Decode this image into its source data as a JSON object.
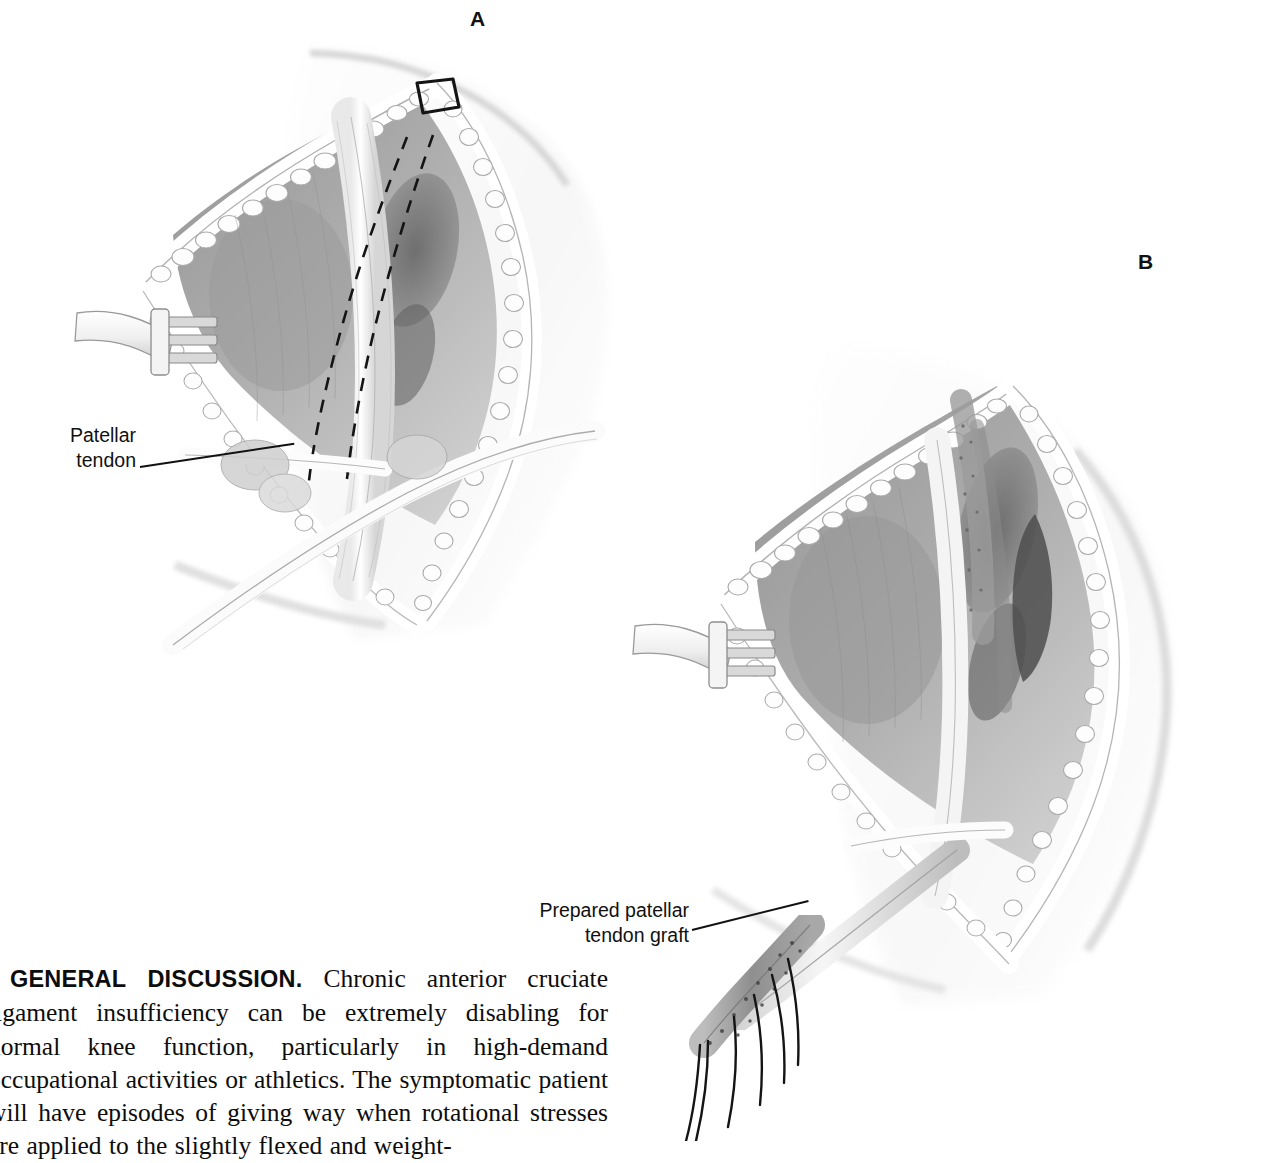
{
  "page": {
    "background_color": "#ffffff",
    "ink_color": "#111111",
    "width": 1264,
    "height": 1141
  },
  "panels": [
    {
      "letter": "A",
      "name": "panel-a",
      "description": "Open knee exposure with rake retractor, patellar tendon exposed, dashed graft-harvest lines and proximal bone-block outline",
      "callout": {
        "text": "Patellar\ntendon",
        "line1": "Patellar",
        "line2": "tendon"
      }
    },
    {
      "letter": "B",
      "name": "panel-b",
      "description": "Same exposure after graft harvest; prepared patellar tendon graft with bone plugs and suture strands delivered out of the wound",
      "callout": {
        "text": "Prepared patellar\ntendon graft",
        "line1": "Prepared patellar",
        "line2": "tendon graft"
      }
    }
  ],
  "body_text": {
    "heading": "GENERAL DISCUSSION.",
    "paragraph": "Chronic anterior cruciate ligament insufficiency can be extremely disabling for normal knee function, particularly in high-demand occupational activities or athletics. The symptomatic patient will have episodes of giving way when rotational stresses are applied to the slightly flexed and weight-",
    "lines": [
      "GENERAL DISCUSSION. Chronic anterior cruciate",
      "ligament insufficiency can be extremely disabling for",
      "normal knee function, particularly in high-demand oc-",
      "cupational activities or athletics. The symptomatic pa-",
      "tient will have episodes of giving way when rotational",
      "stresses are applied to the slightly flexed and weight-"
    ]
  },
  "artwork": {
    "style": "halftone pen-and-ink medical illustration, grayscale",
    "elements_panel_a": [
      "skin-incision-edges",
      "rake-retractor",
      "ribbon-retractor",
      "patellar-tendon",
      "dashed-harvest-lines",
      "bone-block-outline",
      "fat-pad",
      "tibial-tubercle"
    ],
    "elements_panel_b": [
      "skin-incision-edges",
      "rake-retractor",
      "harvest-defect",
      "prepared-graft",
      "bone-plug",
      "suture-strands"
    ]
  }
}
